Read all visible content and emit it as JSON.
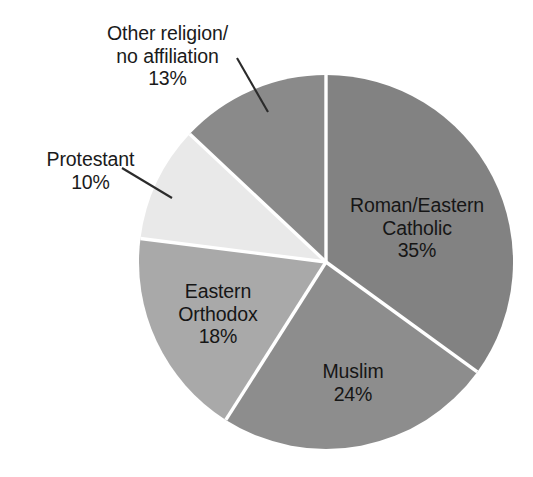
{
  "chart_data": {
    "type": "pie",
    "title": "",
    "subtitle": "",
    "xlabel": "",
    "ylabel": "",
    "legend_position": "none",
    "grid": false,
    "start_angle_deg": 0,
    "direction": "clockwise",
    "unit": "%",
    "categories": [
      "Roman/Eastern Catholic",
      "Muslim",
      "Eastern Orthodox",
      "Protestant",
      "Other religion/no affiliation"
    ],
    "values": [
      35,
      24,
      18,
      10,
      13
    ],
    "slices": [
      {
        "id": "catholic",
        "name": "Roman/Eastern Catholic",
        "label_line1": "Roman/Eastern",
        "label_line2": "Catholic",
        "value": 35,
        "value_text": "35%",
        "color": "#828282",
        "label_placement": "inside"
      },
      {
        "id": "muslim",
        "name": "Muslim",
        "label_line1": "Muslim",
        "label_line2": "",
        "value": 24,
        "value_text": "24%",
        "color": "#8d8d8d",
        "label_placement": "inside"
      },
      {
        "id": "orthodox",
        "name": "Eastern Orthodox",
        "label_line1": "Eastern",
        "label_line2": "Orthodox",
        "value": 18,
        "value_text": "18%",
        "color": "#a9a9a9",
        "label_placement": "inside"
      },
      {
        "id": "protestant",
        "name": "Protestant",
        "label_line1": "Protestant",
        "label_line2": "",
        "value": 10,
        "value_text": "10%",
        "color": "#e9e9e9",
        "label_placement": "outside"
      },
      {
        "id": "other",
        "name": "Other religion/no affiliation",
        "label_line1": "Other religion/",
        "label_line2": "no affiliation",
        "value": 13,
        "value_text": "13%",
        "color": "#8a8a8a",
        "label_placement": "outside"
      }
    ],
    "colors": {
      "background": "#ffffff",
      "separator": "#ffffff",
      "text": "#1a1a1a",
      "leader_line": "#2b2b2b"
    }
  }
}
